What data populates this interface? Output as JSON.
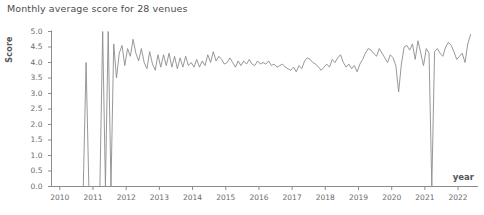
{
  "chart_data": {
    "type": "line",
    "title": "Monthly average score for 28 venues",
    "xlabel": "year",
    "ylabel": "Score",
    "xlim": [
      2009.75,
      2022.6
    ],
    "ylim": [
      0.0,
      5.0
    ],
    "grid": false,
    "legend": null,
    "line_color": "#8c8c8c",
    "axis_color": "#8c8c8c",
    "text_color": "#5a5a5a",
    "ytick_labels": [
      "0.0",
      "0.5",
      "1.0",
      "1.5",
      "2.0",
      "2.5",
      "3.0",
      "3.5",
      "4.0",
      "4.5",
      "5.0"
    ],
    "ytick_values": [
      0.0,
      0.5,
      1.0,
      1.5,
      2.0,
      2.5,
      3.0,
      3.5,
      4.0,
      4.5,
      5.0
    ],
    "xtick_labels": [
      "2010",
      "2011",
      "2012",
      "2013",
      "2014",
      "2015",
      "2016",
      "2017",
      "2018",
      "2019",
      "2020",
      "2021",
      "2022"
    ],
    "xtick_values": [
      2010,
      2011,
      2012,
      2013,
      2014,
      2015,
      2016,
      2017,
      2018,
      2019,
      2020,
      2021,
      2022
    ],
    "series_name": "Monthly average score",
    "x": [
      2010.708,
      2010.792,
      2010.875,
      2010.958,
      2011.042,
      2011.125,
      2011.208,
      2011.292,
      2011.375,
      2011.458,
      2011.542,
      2011.625,
      2011.708,
      2011.792,
      2011.875,
      2011.958,
      2012.042,
      2012.125,
      2012.208,
      2012.292,
      2012.375,
      2012.458,
      2012.542,
      2012.625,
      2012.708,
      2012.792,
      2012.875,
      2012.958,
      2013.042,
      2013.125,
      2013.208,
      2013.292,
      2013.375,
      2013.458,
      2013.542,
      2013.625,
      2013.708,
      2013.792,
      2013.875,
      2013.958,
      2014.042,
      2014.125,
      2014.208,
      2014.292,
      2014.375,
      2014.458,
      2014.542,
      2014.625,
      2014.708,
      2014.792,
      2014.875,
      2014.958,
      2015.042,
      2015.125,
      2015.208,
      2015.292,
      2015.375,
      2015.458,
      2015.542,
      2015.625,
      2015.708,
      2015.792,
      2015.875,
      2015.958,
      2016.042,
      2016.125,
      2016.208,
      2016.292,
      2016.375,
      2016.458,
      2016.542,
      2016.625,
      2016.708,
      2016.792,
      2016.875,
      2016.958,
      2017.042,
      2017.125,
      2017.208,
      2017.292,
      2017.375,
      2017.458,
      2017.542,
      2017.625,
      2017.708,
      2017.792,
      2017.875,
      2017.958,
      2018.042,
      2018.125,
      2018.208,
      2018.292,
      2018.375,
      2018.458,
      2018.542,
      2018.625,
      2018.708,
      2018.792,
      2018.875,
      2018.958,
      2019.042,
      2019.125,
      2019.208,
      2019.292,
      2019.375,
      2019.458,
      2019.542,
      2019.625,
      2019.708,
      2019.792,
      2019.875,
      2019.958,
      2020.042,
      2020.125,
      2020.208,
      2020.292,
      2020.375,
      2020.458,
      2020.542,
      2020.625,
      2020.708,
      2020.792,
      2020.875,
      2020.958,
      2021.042,
      2021.125,
      2021.208,
      2021.292,
      2021.375,
      2021.458,
      2021.542,
      2021.625,
      2021.708,
      2021.792,
      2021.875,
      2021.958,
      2022.042,
      2022.125,
      2022.208,
      2022.292,
      2022.375
    ],
    "values": [
      0.0,
      4.0,
      0.0,
      0.0,
      0.0,
      0.0,
      0.0,
      5.0,
      0.0,
      5.0,
      0.0,
      4.6,
      3.5,
      4.3,
      4.55,
      3.9,
      4.45,
      4.2,
      4.75,
      4.3,
      4.05,
      4.45,
      4.0,
      3.8,
      4.35,
      3.95,
      3.75,
      4.25,
      3.85,
      4.25,
      3.9,
      4.3,
      3.85,
      4.2,
      3.8,
      4.15,
      3.85,
      4.2,
      3.9,
      4.0,
      3.85,
      4.1,
      3.85,
      4.05,
      3.9,
      4.25,
      4.0,
      4.35,
      4.05,
      4.2,
      4.1,
      3.95,
      4.0,
      4.15,
      4.0,
      3.85,
      4.05,
      3.9,
      4.05,
      3.95,
      4.1,
      3.95,
      3.9,
      4.05,
      3.95,
      4.0,
      3.95,
      4.05,
      3.9,
      3.95,
      3.85,
      3.9,
      3.95,
      3.85,
      3.8,
      3.75,
      3.85,
      3.7,
      3.9,
      3.8,
      4.05,
      4.15,
      4.1,
      4.0,
      3.95,
      3.85,
      3.75,
      3.85,
      3.95,
      3.85,
      4.1,
      4.0,
      4.15,
      4.25,
      4.0,
      3.85,
      3.95,
      3.8,
      3.9,
      3.7,
      3.95,
      4.1,
      4.3,
      4.45,
      4.4,
      4.3,
      4.2,
      4.45,
      4.3,
      4.15,
      4.0,
      4.25,
      4.15,
      3.9,
      3.05,
      3.95,
      4.5,
      4.55,
      4.4,
      4.6,
      4.1,
      4.7,
      4.3,
      3.9,
      4.45,
      4.3,
      0.0,
      4.35,
      4.45,
      4.3,
      4.2,
      4.5,
      4.65,
      4.55,
      4.35,
      4.1,
      4.2,
      4.3,
      4.0,
      4.6,
      4.9
    ]
  }
}
